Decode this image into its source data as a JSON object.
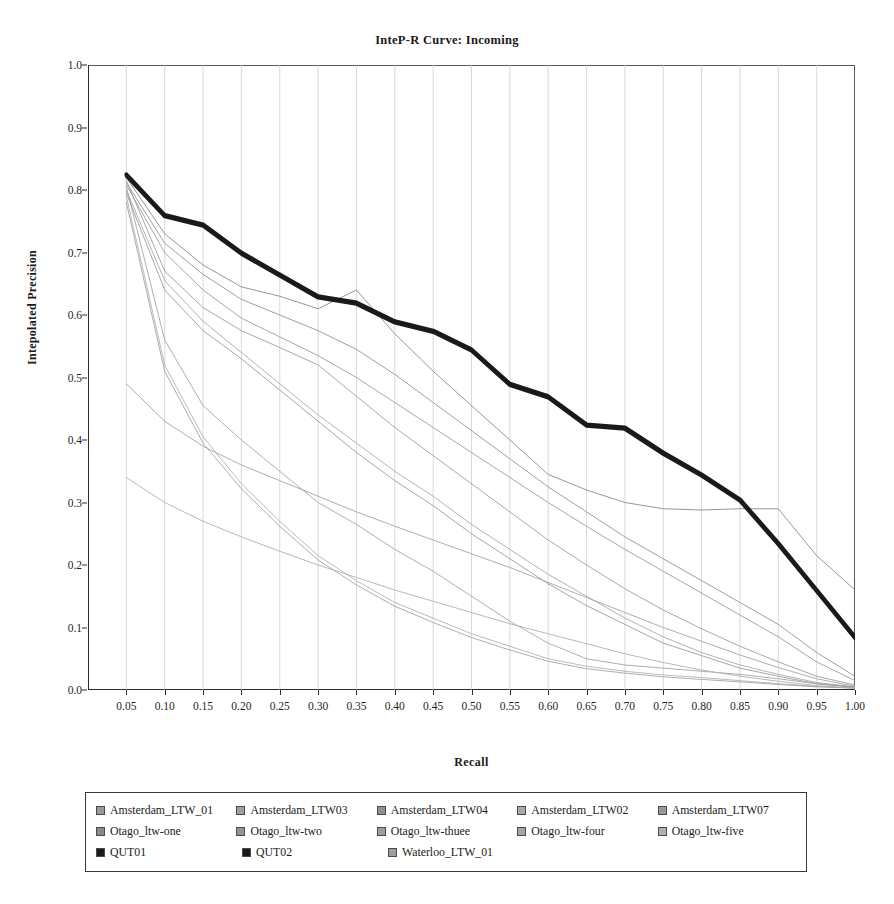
{
  "chart": {
    "title": "InteP-R Curve: Incoming",
    "xlabel": "Recall",
    "ylabel": "Intepolated Precision"
  },
  "chart_data": {
    "type": "line",
    "title": "InteP-R Curve: Incoming",
    "xlabel": "Recall",
    "ylabel": "Intepolated Precision",
    "xlim": [
      0.0,
      1.0
    ],
    "ylim": [
      0.0,
      1.0
    ],
    "grid": "vertical",
    "legend_position": "bottom",
    "x_ticks": [
      "0.05",
      "0.10",
      "0.15",
      "0.20",
      "0.25",
      "0.30",
      "0.35",
      "0.40",
      "0.45",
      "0.50",
      "0.55",
      "0.60",
      "0.65",
      "0.70",
      "0.75",
      "0.80",
      "0.85",
      "0.90",
      "0.95",
      "1.00"
    ],
    "y_ticks": [
      "0.0",
      "0.1",
      "0.2",
      "0.3",
      "0.4",
      "0.5",
      "0.6",
      "0.7",
      "0.8",
      "0.9",
      "1.0"
    ],
    "x": [
      0.05,
      0.1,
      0.15,
      0.2,
      0.25,
      0.3,
      0.35,
      0.4,
      0.45,
      0.5,
      0.55,
      0.6,
      0.65,
      0.7,
      0.75,
      0.8,
      0.85,
      0.9,
      0.95,
      1.0
    ],
    "series": [
      {
        "name": "Amsterdam_LTW_01",
        "color": "#9a9a9a",
        "width": 0.8,
        "values": [
          0.805,
          0.56,
          0.455,
          0.4,
          0.35,
          0.3,
          0.265,
          0.225,
          0.19,
          0.15,
          0.11,
          0.075,
          0.05,
          0.04,
          0.035,
          0.03,
          0.025,
          0.018,
          0.01,
          0.005
        ]
      },
      {
        "name": "Amsterdam_LTW03",
        "color": "#a0a0a0",
        "width": 0.8,
        "values": [
          0.8,
          0.655,
          0.59,
          0.54,
          0.49,
          0.44,
          0.395,
          0.35,
          0.31,
          0.265,
          0.225,
          0.185,
          0.15,
          0.115,
          0.085,
          0.06,
          0.04,
          0.025,
          0.012,
          0.005
        ]
      },
      {
        "name": "Amsterdam_LTW04",
        "color": "#8f8f8f",
        "width": 0.8,
        "values": [
          0.795,
          0.64,
          0.575,
          0.53,
          0.48,
          0.43,
          0.38,
          0.335,
          0.295,
          0.25,
          0.21,
          0.17,
          0.135,
          0.105,
          0.075,
          0.055,
          0.035,
          0.022,
          0.01,
          0.004
        ]
      },
      {
        "name": "Amsterdam_LTW02",
        "color": "#aaaaaa",
        "width": 0.8,
        "values": [
          0.79,
          0.52,
          0.405,
          0.33,
          0.27,
          0.215,
          0.175,
          0.14,
          0.115,
          0.09,
          0.07,
          0.05,
          0.038,
          0.03,
          0.024,
          0.02,
          0.015,
          0.01,
          0.006,
          0.003
        ]
      },
      {
        "name": "Amsterdam_LTW07",
        "color": "#999999",
        "width": 0.8,
        "values": [
          0.78,
          0.51,
          0.395,
          0.322,
          0.262,
          0.208,
          0.168,
          0.134,
          0.108,
          0.084,
          0.064,
          0.046,
          0.034,
          0.027,
          0.021,
          0.017,
          0.013,
          0.009,
          0.005,
          0.003
        ]
      },
      {
        "name": "Otago_ltw-one",
        "color": "#8a8a8a",
        "width": 0.9,
        "values": [
          0.82,
          0.73,
          0.68,
          0.645,
          0.63,
          0.61,
          0.64,
          0.57,
          0.51,
          0.455,
          0.4,
          0.345,
          0.32,
          0.3,
          0.29,
          0.288,
          0.29,
          0.29,
          0.215,
          0.16
        ]
      },
      {
        "name": "Otago_ltw-two",
        "color": "#949494",
        "width": 0.9,
        "values": [
          0.812,
          0.715,
          0.665,
          0.625,
          0.6,
          0.575,
          0.545,
          0.505,
          0.46,
          0.415,
          0.37,
          0.325,
          0.285,
          0.245,
          0.21,
          0.175,
          0.14,
          0.105,
          0.06,
          0.022
        ]
      },
      {
        "name": "Otago_ltw-thuee",
        "color": "#9d9d9d",
        "width": 0.9,
        "values": [
          0.808,
          0.7,
          0.64,
          0.595,
          0.565,
          0.535,
          0.5,
          0.46,
          0.42,
          0.38,
          0.34,
          0.3,
          0.262,
          0.225,
          0.19,
          0.155,
          0.12,
          0.085,
          0.045,
          0.015
        ]
      },
      {
        "name": "Otago_ltw-four",
        "color": "#a5a5a5",
        "width": 0.9,
        "values": [
          0.49,
          0.43,
          0.39,
          0.36,
          0.335,
          0.31,
          0.285,
          0.262,
          0.24,
          0.218,
          0.196,
          0.172,
          0.148,
          0.124,
          0.1,
          0.078,
          0.056,
          0.036,
          0.018,
          0.006
        ]
      },
      {
        "name": "Otago_ltw-five",
        "color": "#b0b0b0",
        "width": 0.9,
        "values": [
          0.34,
          0.3,
          0.27,
          0.245,
          0.222,
          0.2,
          0.18,
          0.16,
          0.142,
          0.124,
          0.106,
          0.09,
          0.074,
          0.058,
          0.044,
          0.032,
          0.022,
          0.014,
          0.007,
          0.003
        ]
      },
      {
        "name": "QUT01",
        "color": "#1a1a1a",
        "width": 4.0,
        "values": [
          0.825,
          0.76,
          0.745,
          0.7,
          0.665,
          0.63,
          0.62,
          0.59,
          0.575,
          0.545,
          0.49,
          0.47,
          0.425,
          0.42,
          0.38,
          0.345,
          0.305,
          0.235,
          0.16,
          0.085
        ]
      },
      {
        "name": "QUT02",
        "color": "#1a1a1a",
        "width": 3.0,
        "values": [
          0.822,
          0.757,
          0.742,
          0.697,
          0.662,
          0.627,
          0.617,
          0.587,
          0.572,
          0.542,
          0.487,
          0.467,
          0.422,
          0.417,
          0.377,
          0.342,
          0.302,
          0.232,
          0.157,
          0.082
        ]
      },
      {
        "name": "Waterloo_LTW_01",
        "color": "#9e9e9e",
        "width": 0.9,
        "values": [
          0.815,
          0.67,
          0.612,
          0.575,
          0.548,
          0.52,
          0.47,
          0.42,
          0.375,
          0.33,
          0.285,
          0.24,
          0.2,
          0.162,
          0.128,
          0.098,
          0.07,
          0.045,
          0.022,
          0.008
        ]
      }
    ]
  },
  "legend": {
    "rows": [
      [
        {
          "label": "Amsterdam_LTW_01",
          "color": "#9a9a9a"
        },
        {
          "label": "Amsterdam_LTW03",
          "color": "#a0a0a0"
        },
        {
          "label": "Amsterdam_LTW04",
          "color": "#8f8f8f"
        },
        {
          "label": "Amsterdam_LTW02",
          "color": "#aaaaaa"
        },
        {
          "label": "Amsterdam_LTW07",
          "color": "#999999"
        }
      ],
      [
        {
          "label": "Otago_ltw-one",
          "color": "#8a8a8a"
        },
        {
          "label": "Otago_ltw-two",
          "color": "#949494"
        },
        {
          "label": "Otago_ltw-thuee",
          "color": "#9d9d9d"
        },
        {
          "label": "Otago_ltw-four",
          "color": "#a5a5a5"
        },
        {
          "label": "Otago_ltw-five",
          "color": "#b0b0b0"
        }
      ],
      [
        {
          "label": "QUT01",
          "color": "#1a1a1a"
        },
        {
          "label": "QUT02",
          "color": "#1a1a1a"
        },
        {
          "label": "Waterloo_LTW_01",
          "color": "#9e9e9e"
        }
      ]
    ]
  }
}
